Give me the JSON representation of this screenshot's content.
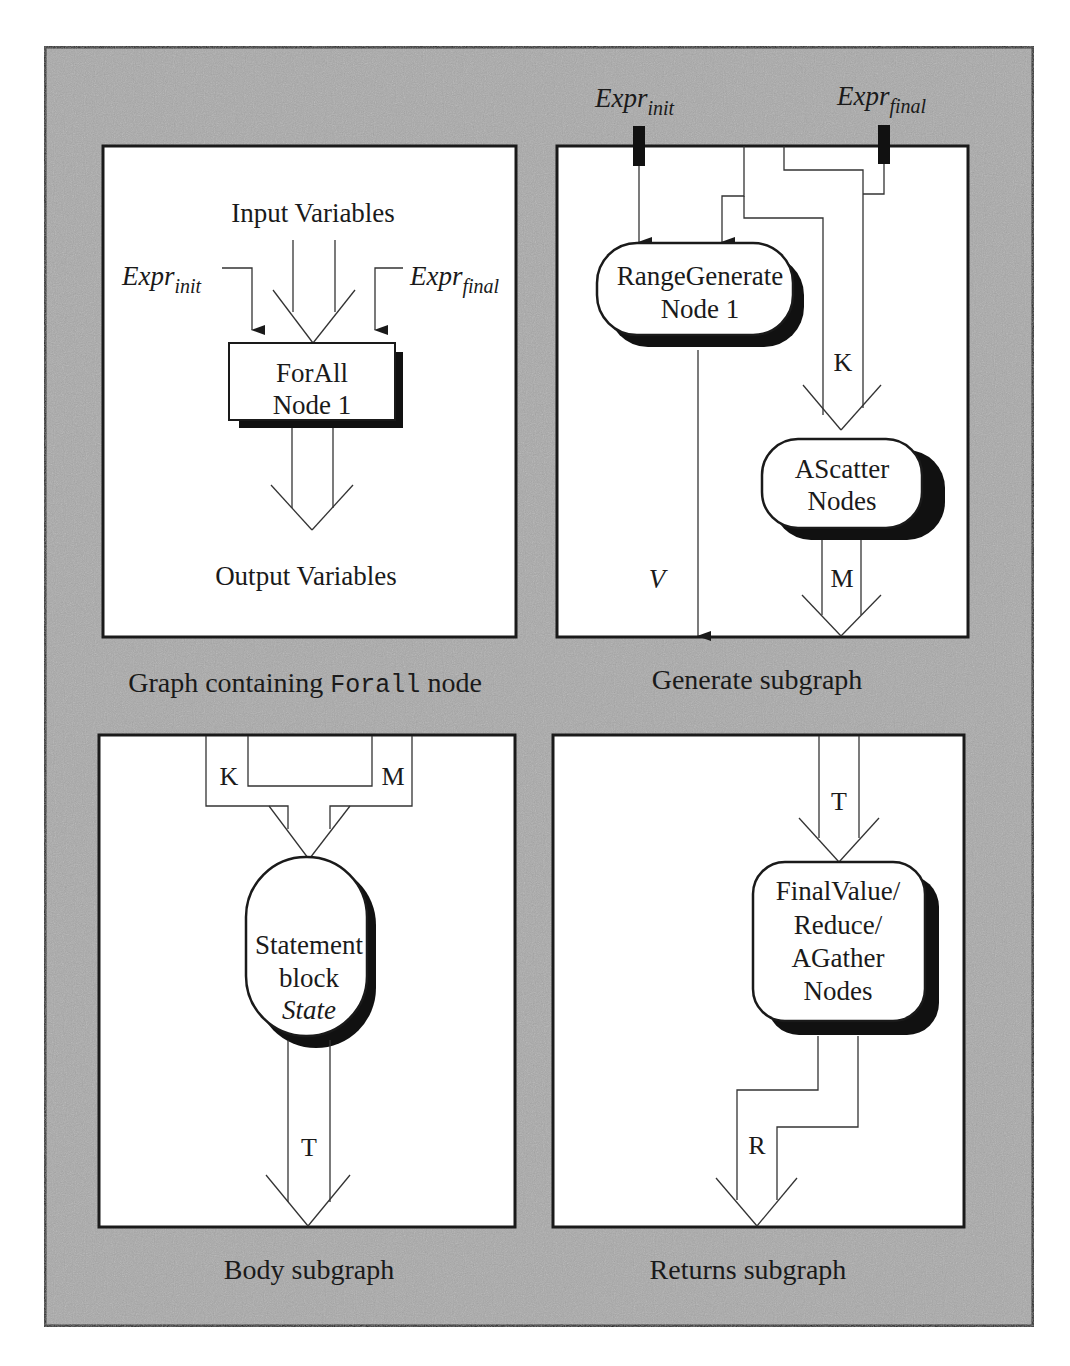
{
  "colors": {
    "frame_border": "#1a1a1a",
    "frame_fill": "#a9a9a9",
    "panel_fill": "#ffffff",
    "shadow": "#111111",
    "line": "#333333"
  },
  "panels": {
    "forall": {
      "caption_prefix": "Graph containing ",
      "caption_code": "Forall",
      "caption_suffix": " node",
      "input_label": "Input Variables",
      "output_label": "Output Variables",
      "expr_init": {
        "base": "Expr",
        "sub": "init"
      },
      "expr_final": {
        "base": "Expr",
        "sub": "final"
      },
      "node": {
        "line1": "ForAll",
        "line2": "Node 1"
      }
    },
    "generate": {
      "caption": "Generate subgraph",
      "expr_init": {
        "base": "Expr",
        "sub": "init"
      },
      "expr_final": {
        "base": "Expr",
        "sub": "final"
      },
      "range_node": {
        "line1": "RangeGenerate",
        "line2": "Node 1"
      },
      "scatter_node": {
        "line1": "AScatter",
        "line2": "Nodes"
      },
      "label_k": "K",
      "label_m": "M",
      "label_v": "V"
    },
    "body": {
      "caption": "Body subgraph",
      "label_k": "K",
      "label_m": "M",
      "label_t": "T",
      "node": {
        "line1": "Statement",
        "line2": "block",
        "line3": "State"
      }
    },
    "returns": {
      "caption": "Returns subgraph",
      "label_t": "T",
      "label_r": "R",
      "node": {
        "line1": "FinalValue/",
        "line2": "Reduce/",
        "line3": "AGather",
        "line4": "Nodes"
      }
    }
  }
}
